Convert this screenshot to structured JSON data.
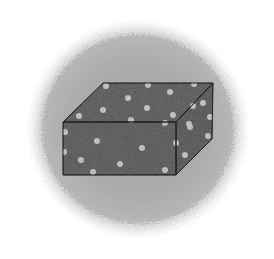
{
  "colors": {
    "background": "#ffffff",
    "cloud_center": "#a6a6a6",
    "cloud_edge": "#d4d4d4",
    "box_fill": "#6f6f6f",
    "box_top_fill": "#707070",
    "box_right_fill": "#6c6c6c",
    "box_stroke": "#2e2e2e",
    "dot_fill": "#d9d9d9"
  },
  "cloud": {
    "cx": 138,
    "cy": 129,
    "rx": 110,
    "ry": 108
  },
  "box": {
    "front": [
      [
        63,
        122
      ],
      [
        176,
        122
      ],
      [
        176,
        175
      ],
      [
        63,
        175
      ]
    ],
    "top": [
      [
        63,
        122
      ],
      [
        103,
        83
      ],
      [
        213,
        83
      ],
      [
        176,
        122
      ]
    ],
    "right": [
      [
        176,
        122
      ],
      [
        213,
        83
      ],
      [
        212,
        139
      ],
      [
        176,
        175
      ]
    ]
  },
  "dots": [
    [
      106,
      86
    ],
    [
      148,
      85
    ],
    [
      170,
      92
    ],
    [
      194,
      84
    ],
    [
      128,
      98
    ],
    [
      103,
      110
    ],
    [
      147,
      108
    ],
    [
      79,
      116
    ],
    [
      173,
      115
    ],
    [
      131,
      120
    ],
    [
      165,
      123
    ],
    [
      189,
      124
    ],
    [
      193,
      106
    ],
    [
      203,
      103
    ],
    [
      210,
      117
    ],
    [
      190,
      127
    ],
    [
      208,
      136
    ],
    [
      176,
      143
    ],
    [
      185,
      155
    ],
    [
      65,
      132
    ],
    [
      97,
      141
    ],
    [
      64,
      152
    ],
    [
      81,
      160
    ],
    [
      142,
      148
    ],
    [
      120,
      164
    ],
    [
      93,
      172
    ],
    [
      165,
      170
    ]
  ]
}
